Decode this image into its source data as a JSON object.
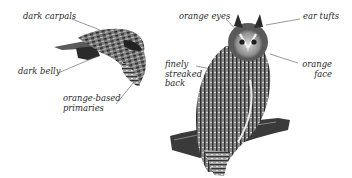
{
  "figure": {
    "flight_owl": {
      "labels": [
        {
          "id": "dark-carpals",
          "text": "dark carpals"
        },
        {
          "id": "dark-belly",
          "text": "dark belly"
        },
        {
          "id": "orange-based-primaries",
          "lines": [
            "orange-based",
            "primaries"
          ]
        }
      ]
    },
    "perched_owl": {
      "labels": [
        {
          "id": "orange-eyes",
          "text": "orange eyes"
        },
        {
          "id": "ear-tufts",
          "text": "ear tufts"
        },
        {
          "id": "finely-streaked-back",
          "lines": [
            "finely",
            "streaked",
            "back"
          ]
        },
        {
          "id": "orange-face",
          "lines": [
            "orange",
            "face"
          ]
        }
      ]
    },
    "colors": {
      "background": "#ffffff",
      "label_text": "#2a2a2a",
      "leader_line": "#555555",
      "plumage_dark": "#2b2b2b",
      "plumage_mid": "#6e6e6e",
      "plumage_light": "#b8b8b8"
    }
  }
}
